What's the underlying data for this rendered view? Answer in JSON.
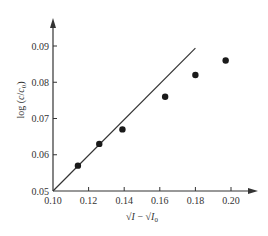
{
  "chart_data": {
    "type": "scatter",
    "title": "",
    "xlabel": "√I − √I₀",
    "ylabel": "log (c/c₀)",
    "xlim": [
      0.1,
      0.21
    ],
    "ylim": [
      0.05,
      0.094
    ],
    "grid": false,
    "legend": null,
    "x_ticks": [
      "0.10",
      "0.12",
      "0.14",
      "0.16",
      "0.18",
      "0.20"
    ],
    "y_ticks": [
      "0.05",
      "0.06",
      "0.07",
      "0.08",
      "0.09"
    ],
    "series": [
      {
        "name": "measured",
        "kind": "scatter",
        "marker": "filled-circle",
        "x": [
          0.114,
          0.126,
          0.139,
          0.163,
          0.18,
          0.197
        ],
        "y": [
          0.057,
          0.063,
          0.067,
          0.076,
          0.082,
          0.086
        ]
      },
      {
        "name": "theoretical line",
        "kind": "line",
        "x": [
          0.1,
          0.18
        ],
        "y": [
          0.05,
          0.0894
        ]
      }
    ],
    "colors": {
      "ink": "#333333",
      "background": "#ffffff"
    }
  },
  "labels": {
    "x_axis": {
      "main": "√I",
      "minus": " − ",
      "sub_main": "√I",
      "sub": "0"
    },
    "y_axis": {
      "prefix": "log (",
      "c": "c",
      "slash": "/",
      "c0": "c",
      "sub": "0",
      "suffix": ")"
    }
  }
}
